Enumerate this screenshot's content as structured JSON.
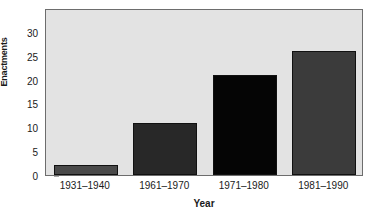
{
  "chart_data": {
    "type": "bar",
    "title": "",
    "xlabel": "Year",
    "ylabel": "Enactments",
    "categories": [
      "1931–1940",
      "1961–1970",
      "1971–1980",
      "1981–1990"
    ],
    "values": [
      2,
      11,
      21,
      26
    ],
    "bar_colors": [
      "#4a4a4a",
      "#282828",
      "#050505",
      "#3b3b3b"
    ],
    "ylim": [
      0,
      35
    ],
    "yticks": [
      0,
      5,
      10,
      15,
      20,
      25,
      30
    ],
    "ytick_labels": [
      "0",
      "5",
      "10",
      "15",
      "20",
      "25",
      "30"
    ],
    "grid": false,
    "legend": "none",
    "plot_background": "#e3e3e3",
    "frame_color": "#6d6d6d",
    "text_color": "#1a1a1a"
  }
}
